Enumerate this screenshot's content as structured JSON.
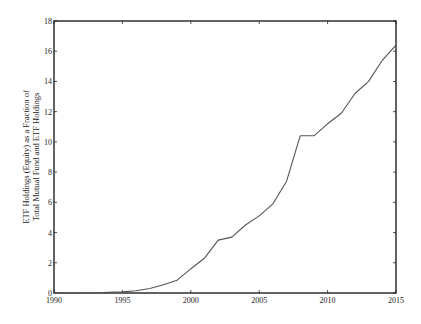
{
  "chart_data": {
    "type": "line",
    "title": "",
    "xlabel": "",
    "ylabel": "ETF Holdings (Equity) as a Fraction of Total Mutual Fund and ETF Holdings",
    "ylabel_lines": [
      "ETF Holdings (Equity) as a Fraction of",
      "Total Mutual Fund and ETF Holdings"
    ],
    "xlim": [
      1990,
      2015
    ],
    "ylim": [
      0,
      18
    ],
    "x_ticks": [
      1990,
      1995,
      2000,
      2005,
      2010,
      2015
    ],
    "y_ticks": [
      0,
      2,
      4,
      6,
      8,
      10,
      12,
      14,
      16,
      18
    ],
    "grid": false,
    "legend": null,
    "series": [
      {
        "name": "ETF share",
        "color": "#555555",
        "x": [
          1990,
          1991,
          1992,
          1993,
          1994,
          1995,
          1996,
          1997,
          1998,
          1999,
          2000,
          2001,
          2002,
          2003,
          2004,
          2005,
          2006,
          2007,
          2008,
          2009,
          2010,
          2011,
          2012,
          2013,
          2014,
          2015
        ],
        "values": [
          0,
          0,
          0,
          0.02,
          0.04,
          0.07,
          0.15,
          0.3,
          0.55,
          0.85,
          1.6,
          2.3,
          3.5,
          3.7,
          4.5,
          5.1,
          5.9,
          7.4,
          10.4,
          10.4,
          11.2,
          11.9,
          13.2,
          14.0,
          15.4,
          16.4
        ]
      }
    ]
  }
}
